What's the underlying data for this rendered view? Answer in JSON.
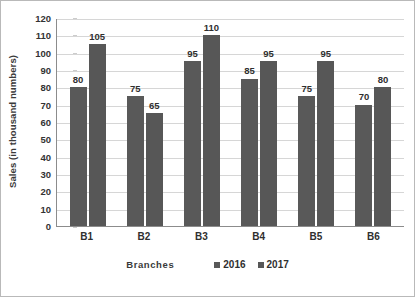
{
  "chart_data": {
    "type": "bar",
    "title": "",
    "xlabel": "Branches",
    "ylabel": "Sales (in thousand numbers)",
    "categories": [
      "B1",
      "B2",
      "B3",
      "B4",
      "B5",
      "B6"
    ],
    "series": [
      {
        "name": "2016",
        "color": "#595959",
        "values": [
          80,
          75,
          95,
          85,
          75,
          70
        ]
      },
      {
        "name": "2017",
        "color": "#575757",
        "values": [
          105,
          65,
          110,
          95,
          95,
          80
        ]
      }
    ],
    "ylim": [
      0,
      120
    ],
    "ytick_step": 10,
    "yticks": [
      120,
      110,
      100,
      90,
      80,
      70,
      60,
      50,
      40,
      30,
      20,
      10,
      0
    ],
    "grid": true,
    "grid_axis": "y",
    "legend_position": "bottom-right",
    "data_labels": true
  },
  "colors": {
    "bar_2016": "#595959",
    "bar_2017": "#575757",
    "gridline": "#d6d6d6",
    "axis": "#8c8c8c",
    "frame": "#b9b9b9",
    "text": "#2f2f2f",
    "background": "#ffffff"
  }
}
